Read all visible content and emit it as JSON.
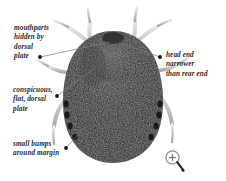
{
  "figure": {
    "background_color": "#ffffff",
    "text_color": "#2b2b2b",
    "body_color": "#0a0a0a",
    "leg_color": "#c9c9c9",
    "leader_line_color": "#7d7d7d"
  },
  "callouts": [
    {
      "id": "mouthparts",
      "text": "mouthparts\nhidden by\ndorsal\nplate",
      "position": "upper-left"
    },
    {
      "id": "dorsal-plate",
      "text": "conspicuous,\nflat, dorsal\nplate",
      "position": "middle-left"
    },
    {
      "id": "margin-bumps",
      "text": "small bumps\naround margin",
      "position": "lower-left"
    },
    {
      "id": "head-end",
      "text": "head end\nnarrower\nthan rear end",
      "position": "upper-right"
    }
  ],
  "icons": {
    "zoom": "magnifier-plus-icon"
  }
}
